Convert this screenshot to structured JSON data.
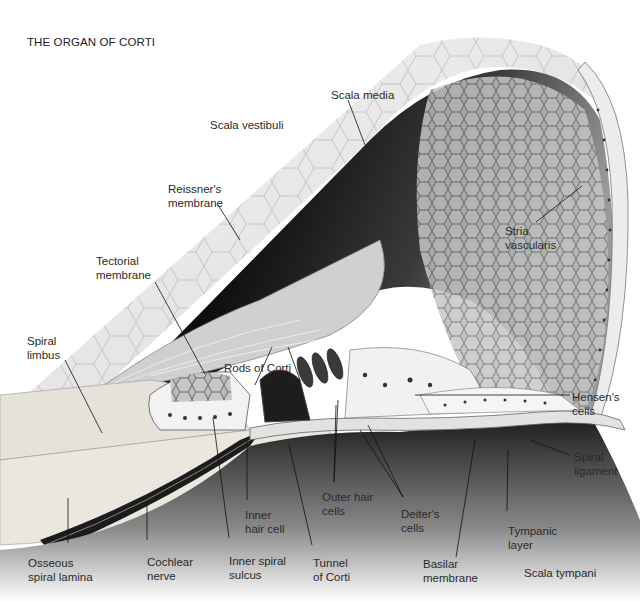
{
  "title": "THE ORGAN OF CORTI",
  "labels": {
    "scala_vestibuli": "Scala vestibuli",
    "scala_media": "Scala media",
    "reissners_membrane": [
      "Reissner's",
      "membrane"
    ],
    "tectorial_membrane": [
      "Tectorial",
      "membrane"
    ],
    "stria_vascularis": [
      "Stria",
      "vascularis"
    ],
    "spiral_limbus": [
      "Spiral",
      "limbus"
    ],
    "rods_of_corti": "Rods of Corti",
    "hensens_cells": [
      "Hensen's",
      "cells"
    ],
    "spiral_ligament": [
      "Spiral",
      "ligament"
    ],
    "outer_hair_cells": [
      "Outer hair",
      "cells"
    ],
    "deiters_cells": [
      "Deiter's",
      "cells"
    ],
    "inner_hair_cell": [
      "Inner",
      "hair cell"
    ],
    "tympanic_layer": [
      "Tympanic",
      "layer"
    ],
    "osseous_spiral_lamina": [
      "Osseous",
      "spiral lamina"
    ],
    "cochlear_nerve": [
      "Cochlear",
      "nerve"
    ],
    "inner_spiral_sulcus": [
      "Inner spiral",
      "sulcus"
    ],
    "tunnel_of_corti": [
      "Tunnel",
      "of Corti"
    ],
    "basilar_membrane": [
      "Basilar",
      "membrane"
    ],
    "scala_tympani": "Scala tympani"
  }
}
